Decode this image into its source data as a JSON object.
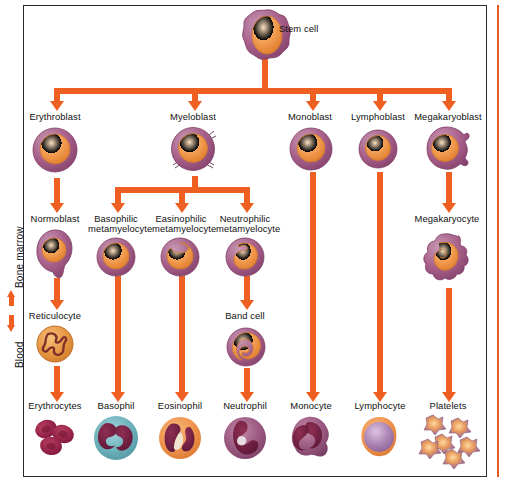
{
  "figure": {
    "axis_labels": {
      "top": "Bone marrow",
      "bottom": "Blood"
    },
    "colors": {
      "arrow": "#ef5f22",
      "cytoplasm": "#9c4f78",
      "nucleus": "#f2913f",
      "frame": "#2a2a2a",
      "basophil_cytoplasm": "#6fb3bd",
      "eosinophil_cytoplasm": "#ef944e",
      "erythrocyte": "#9e2746",
      "lymphocyte_nucleus": "#a87fae",
      "platelet": "#a0718f"
    }
  },
  "rows": {
    "stem": {
      "label": "Stem cell"
    },
    "blast": {
      "items": [
        {
          "label": "Erythroblast"
        },
        {
          "label": "Myeloblast"
        },
        {
          "label": "Monoblast"
        },
        {
          "label": "Lymphoblast"
        },
        {
          "label": "Megakaryoblast"
        }
      ]
    },
    "precursor": {
      "items": [
        {
          "label": "Normoblast"
        },
        {
          "label": "Basophilic metamyelocyte"
        },
        {
          "label": "Easinophilic metamyelocyte"
        },
        {
          "label": "Neutrophilic metamyelocyte"
        },
        {
          "label": "Megakaryocyte"
        }
      ]
    },
    "intermediate": {
      "items": [
        {
          "label": "Reticulocyte"
        },
        {
          "label": "Band cell"
        }
      ]
    },
    "mature": {
      "items": [
        {
          "label": "Erythrocytes"
        },
        {
          "label": "Basophil"
        },
        {
          "label": "Eosinophil"
        },
        {
          "label": "Neutrophil"
        },
        {
          "label": "Monocyte"
        },
        {
          "label": "Lymphocyte"
        },
        {
          "label": "Platelets"
        }
      ]
    }
  }
}
